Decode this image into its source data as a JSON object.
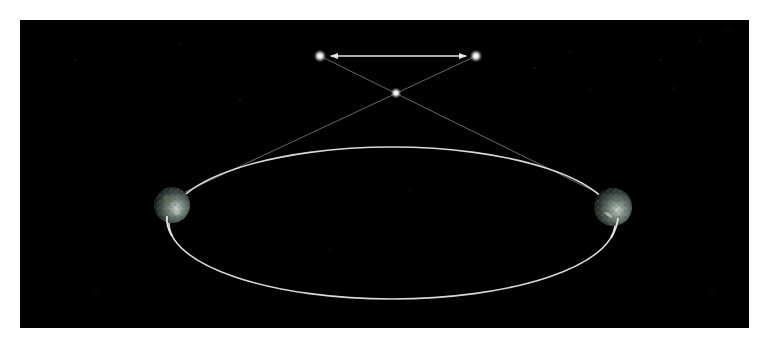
{
  "diagram": {
    "type": "stellar-parallax",
    "colors": {
      "page_background": "#ffffff",
      "space_background": "#000000",
      "orbit_line": "#d8d8d8",
      "sight_line": "#8a8a8a",
      "arrow": "#e6e6e6",
      "star_core": "#ffffff",
      "earth_base": "#4a5a55"
    },
    "space_panel": {
      "x": 20,
      "y": 20,
      "width": 729,
      "height": 308
    },
    "orbit": {
      "cx": 392,
      "cy": 223,
      "rx": 223,
      "ry": 76
    },
    "earth_positions": [
      {
        "id": "earth-left",
        "cx": 172,
        "cy": 205,
        "r": 18
      },
      {
        "id": "earth-right",
        "cx": 613,
        "cy": 207,
        "r": 19
      }
    ],
    "near_star": {
      "cx": 396,
      "cy": 93,
      "r": 5
    },
    "apparent_star_positions": [
      {
        "id": "apparent-left",
        "cx": 320,
        "cy": 56,
        "r": 6
      },
      {
        "id": "apparent-right",
        "cx": 476,
        "cy": 56,
        "r": 6
      }
    ],
    "sight_lines": [
      {
        "from": "earth-left",
        "x1": 185,
        "y1": 192,
        "x2": 476,
        "y2": 56
      },
      {
        "from": "earth-right",
        "x1": 600,
        "y1": 194,
        "x2": 320,
        "y2": 56
      }
    ],
    "parallax_arrow": {
      "x1": 330,
      "y1": 56,
      "x2": 467,
      "y2": 56,
      "double_headed": true
    }
  }
}
